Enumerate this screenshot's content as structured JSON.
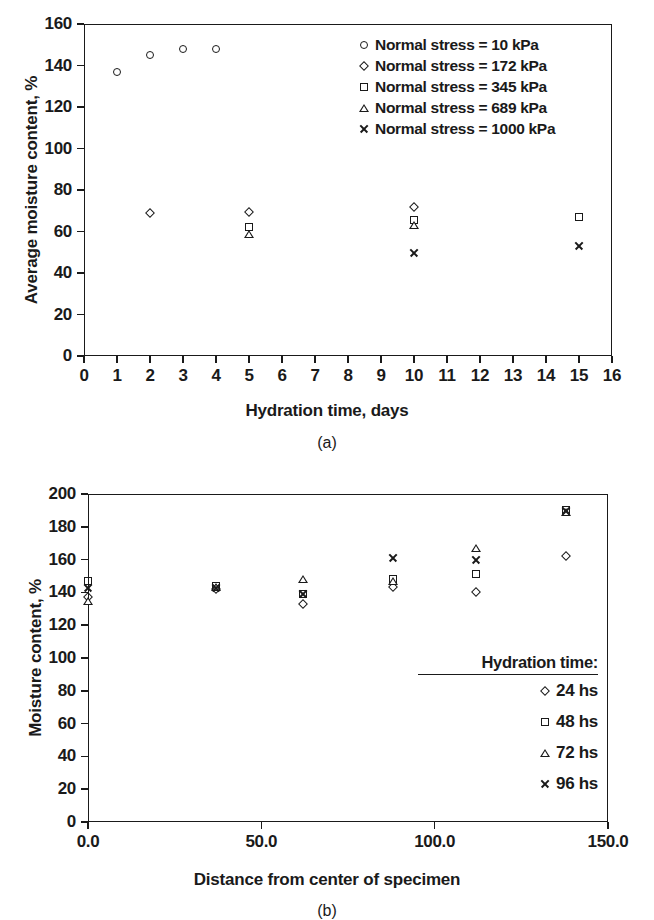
{
  "figure": {
    "panels": [
      {
        "id": "a",
        "caption": "(a)",
        "chart_index": 0
      },
      {
        "id": "b",
        "caption": "(b)",
        "chart_index": 1
      }
    ]
  },
  "chart_data": [
    {
      "type": "scatter",
      "panel": "(a)",
      "title": "",
      "xlabel": "Hydration time, days",
      "ylabel": "Average moisture content, %",
      "xlim": [
        0,
        16
      ],
      "ylim": [
        0,
        160
      ],
      "xticks": [
        0,
        1,
        2,
        3,
        4,
        5,
        6,
        7,
        8,
        9,
        10,
        11,
        12,
        13,
        14,
        15,
        16
      ],
      "xtick_labels": [
        "0",
        "1",
        "2",
        "3",
        "4",
        "5",
        "6",
        "7",
        "8",
        "9",
        "10",
        "11",
        "12",
        "13",
        "14",
        "15",
        "16"
      ],
      "yticks": [
        0,
        20,
        40,
        60,
        80,
        100,
        120,
        140,
        160
      ],
      "ytick_labels": [
        "0",
        "20",
        "40",
        "60",
        "80",
        "100",
        "120",
        "140",
        "160"
      ],
      "grid": false,
      "legend_position": "top-right",
      "series": [
        {
          "name": "Normal stress = 10 kPa",
          "marker": "circle",
          "points": [
            {
              "x": 1,
              "y": 137
            },
            {
              "x": 2,
              "y": 145
            },
            {
              "x": 3,
              "y": 148
            },
            {
              "x": 4,
              "y": 148
            }
          ]
        },
        {
          "name": "Normal stress = 172 kPa",
          "marker": "diamond",
          "points": [
            {
              "x": 2,
              "y": 69
            },
            {
              "x": 5,
              "y": 69.5
            },
            {
              "x": 10,
              "y": 72
            }
          ]
        },
        {
          "name": "Normal stress = 345 kPa",
          "marker": "square",
          "points": [
            {
              "x": 5,
              "y": 62
            },
            {
              "x": 10,
              "y": 65.5
            },
            {
              "x": 15,
              "y": 67
            }
          ]
        },
        {
          "name": "Normal stress = 689 kPa",
          "marker": "triangle",
          "points": [
            {
              "x": 5,
              "y": 59
            },
            {
              "x": 10,
              "y": 63
            }
          ]
        },
        {
          "name": "Normal stress = 1000 kPa",
          "marker": "cross",
          "points": [
            {
              "x": 10,
              "y": 50
            },
            {
              "x": 15,
              "y": 53
            }
          ]
        }
      ]
    },
    {
      "type": "scatter",
      "panel": "(b)",
      "title": "",
      "xlabel": "Distance from center of specimen",
      "ylabel": "Moisture content, %",
      "xlim": [
        0,
        150
      ],
      "ylim": [
        0,
        200
      ],
      "xticks": [
        0,
        50,
        100,
        150
      ],
      "xtick_labels": [
        "0.0",
        "50.0",
        "100.0",
        "150.0"
      ],
      "yticks": [
        0,
        20,
        40,
        60,
        80,
        100,
        120,
        140,
        160,
        180,
        200
      ],
      "ytick_labels": [
        "0",
        "20",
        "40",
        "60",
        "80",
        "100",
        "120",
        "140",
        "160",
        "180",
        "200"
      ],
      "grid": false,
      "legend_title": "Hydration time:",
      "legend_position": "bottom-right",
      "series": [
        {
          "name": "24 hs",
          "marker": "diamond",
          "points": [
            {
              "x": 0,
              "y": 137
            },
            {
              "x": 37,
              "y": 142
            },
            {
              "x": 62,
              "y": 133
            },
            {
              "x": 88,
              "y": 143
            },
            {
              "x": 112,
              "y": 140
            },
            {
              "x": 138,
              "y": 162
            }
          ]
        },
        {
          "name": "48 hs",
          "marker": "square",
          "points": [
            {
              "x": 0,
              "y": 147
            },
            {
              "x": 37,
              "y": 144
            },
            {
              "x": 62,
              "y": 139
            },
            {
              "x": 88,
              "y": 148
            },
            {
              "x": 112,
              "y": 151
            },
            {
              "x": 138,
              "y": 190
            }
          ]
        },
        {
          "name": "72 hs",
          "marker": "triangle",
          "points": [
            {
              "x": 0,
              "y": 135
            },
            {
              "x": 37,
              "y": 143
            },
            {
              "x": 62,
              "y": 148
            },
            {
              "x": 88,
              "y": 147
            },
            {
              "x": 112,
              "y": 167
            },
            {
              "x": 138,
              "y": 189
            }
          ]
        },
        {
          "name": "96 hs",
          "marker": "cross",
          "points": [
            {
              "x": 0,
              "y": 143
            },
            {
              "x": 37,
              "y": 143
            },
            {
              "x": 62,
              "y": 139
            },
            {
              "x": 88,
              "y": 161
            },
            {
              "x": 112,
              "y": 160
            },
            {
              "x": 138,
              "y": 190
            }
          ]
        }
      ]
    }
  ]
}
